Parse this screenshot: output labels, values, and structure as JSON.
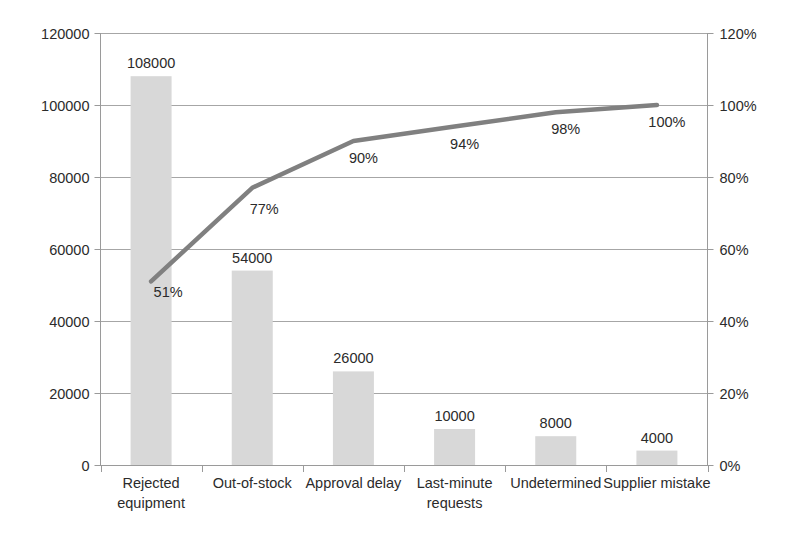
{
  "chart_data": {
    "type": "bar",
    "title": "",
    "subtitle": "",
    "xlabel": "",
    "ylabel": "",
    "categories": [
      "Rejected equipment",
      "Out-of-stock",
      "Approval delay",
      "Last-minute requests",
      "Undetermined",
      "Supplier mistake"
    ],
    "category_lines": [
      [
        "Rejected",
        "equipment"
      ],
      [
        "Out-of-stock"
      ],
      [
        "Approval delay"
      ],
      [
        "Last-minute",
        "requests"
      ],
      [
        "Undetermined"
      ],
      [
        "Supplier mistake"
      ]
    ],
    "series": [
      {
        "name": "Frequency",
        "type": "bar",
        "axis": "left",
        "values": [
          108000,
          54000,
          26000,
          10000,
          8000,
          4000
        ],
        "labels": [
          "108000",
          "54000",
          "26000",
          "10000",
          "8000",
          "4000"
        ],
        "color": "#d8d8d8"
      },
      {
        "name": "Cumulative percentage",
        "type": "line",
        "axis": "right",
        "values": [
          51,
          77,
          90,
          94,
          98,
          100
        ],
        "labels": [
          "51%",
          "77%",
          "90%",
          "94%",
          "98%",
          "100%"
        ],
        "color": "#808080"
      }
    ],
    "left_axis": {
      "ticks": [
        0,
        20000,
        40000,
        60000,
        80000,
        100000,
        120000
      ],
      "tick_labels": [
        "0",
        "20000",
        "40000",
        "60000",
        "80000",
        "100000",
        "120000"
      ],
      "ylim": [
        0,
        120000
      ]
    },
    "right_axis": {
      "ticks": [
        0,
        20,
        40,
        60,
        80,
        100,
        120
      ],
      "tick_labels": [
        "0%",
        "20%",
        "40%",
        "60%",
        "80%",
        "100%",
        "120%"
      ],
      "ylim": [
        0,
        120
      ]
    },
    "grid": true,
    "legend": "none",
    "colors": {
      "bar": "#d8d8d8",
      "line": "#808080",
      "grid": "#a6a6a6",
      "axis": "#9a9a9a",
      "text": "#2b2b2b",
      "background": "#ffffff"
    }
  }
}
